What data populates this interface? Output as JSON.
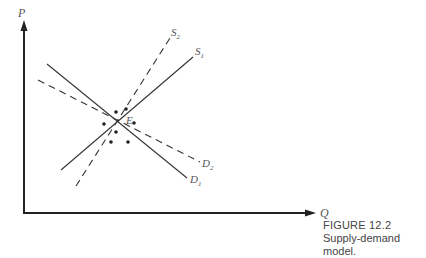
{
  "figure": {
    "number_label": "FIGURE 12.2",
    "caption": "Supply-demand model."
  },
  "axes": {
    "y_label": "P",
    "x_label": "Q"
  },
  "curves": {
    "S1": {
      "label": "S",
      "sub": "1",
      "style": "solid",
      "from": [
        61,
        170
      ],
      "to": [
        193,
        57
      ]
    },
    "S2": {
      "label": "S",
      "sub": "2",
      "style": "dashed",
      "from": [
        76,
        186
      ],
      "to": [
        170,
        38
      ]
    },
    "D1": {
      "label": "D",
      "sub": "1",
      "style": "solid",
      "from": [
        47,
        64
      ],
      "to": [
        187,
        178
      ]
    },
    "D2": {
      "label": "D",
      "sub": "2",
      "style": "dashed",
      "from": [
        38,
        80
      ],
      "to": [
        200,
        162
      ]
    }
  },
  "equilibrium": {
    "label": "E",
    "point": [
      117,
      122
    ]
  },
  "scatter_points": [
    [
      126,
      109
    ],
    [
      116,
      112
    ],
    [
      102,
      124
    ],
    [
      135,
      122
    ],
    [
      116,
      131
    ],
    [
      111,
      141
    ],
    [
      129,
      141
    ]
  ],
  "colors": {
    "line": "#333333",
    "text": "#555555"
  }
}
